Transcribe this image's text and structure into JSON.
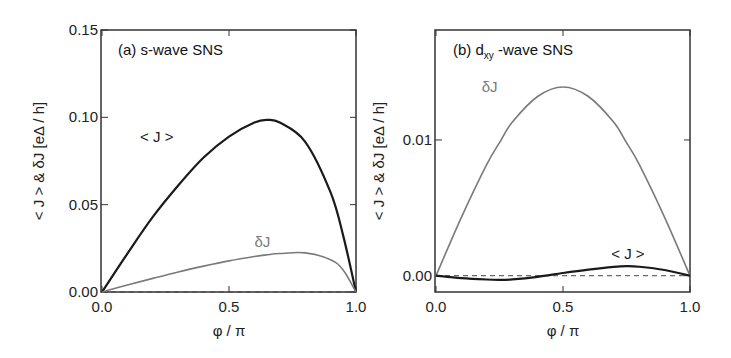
{
  "chart_data": [
    {
      "type": "line",
      "panel": "a",
      "title": "(a) s-wave SNS",
      "xlabel": "φ / π",
      "ylabel": "< J > & δJ [eΔ / h]",
      "xlim": [
        0,
        1
      ],
      "ylim": [
        0,
        0.15
      ],
      "xticks": [
        0.0,
        0.5,
        1.0
      ],
      "xtick_labels": [
        "0.0",
        "0.5",
        "1.0"
      ],
      "yticks": [
        0.0,
        0.05,
        0.1,
        0.15
      ],
      "ytick_labels": [
        "0.00",
        "0.05",
        "0.10",
        "0.15"
      ],
      "grid": false,
      "zero_line": "dashed",
      "x": [
        0.0,
        0.1,
        0.2,
        0.3,
        0.4,
        0.5,
        0.6,
        0.65,
        0.7,
        0.8,
        0.9,
        0.95,
        1.0
      ],
      "series": [
        {
          "name": "< J >",
          "color": "#1a1a1a",
          "values": [
            0.0,
            0.022,
            0.043,
            0.061,
            0.077,
            0.089,
            0.097,
            0.0985,
            0.097,
            0.086,
            0.057,
            0.032,
            0.0
          ]
        },
        {
          "name": "δJ",
          "color": "#7a7a7a",
          "values": [
            0.0,
            0.004,
            0.0078,
            0.0115,
            0.0148,
            0.0178,
            0.0203,
            0.0213,
            0.022,
            0.0224,
            0.0185,
            0.0125,
            0.0
          ]
        }
      ],
      "annotations": [
        {
          "text": "< J >",
          "x": 0.15,
          "y": 0.086,
          "color": "#1a1a1a"
        },
        {
          "text": "δJ",
          "x": 0.6,
          "y": 0.026,
          "color": "#7a7a7a"
        }
      ]
    },
    {
      "type": "line",
      "panel": "b",
      "title": "(b) dxy -wave SNS",
      "xlabel": "φ / π",
      "ylabel": "< J > & δJ [eΔ / h]",
      "xlim": [
        0,
        1
      ],
      "ylim": [
        -0.0012,
        0.0181
      ],
      "xticks": [
        0.0,
        0.5,
        1.0
      ],
      "xtick_labels": [
        "0.0",
        "0.5",
        "1.0"
      ],
      "yticks": [
        0.0,
        0.01
      ],
      "ytick_labels": [
        "0.00",
        "0.01"
      ],
      "grid": false,
      "zero_line": "dashed",
      "x": [
        0.0,
        0.1,
        0.2,
        0.25,
        0.3,
        0.4,
        0.5,
        0.6,
        0.7,
        0.75,
        0.8,
        0.9,
        1.0
      ],
      "series": [
        {
          "name": "δJ",
          "color": "#7a7a7a",
          "values": [
            0.0,
            0.0043,
            0.0082,
            0.0098,
            0.0113,
            0.0132,
            0.0139,
            0.0132,
            0.0113,
            0.0098,
            0.0082,
            0.0043,
            0.0
          ]
        },
        {
          "name": "< J >",
          "color": "#1a1a1a",
          "values": [
            0.0,
            -0.00018,
            -0.00028,
            -0.0003,
            -0.00027,
            -8e-05,
            0.0002,
            0.00045,
            0.00065,
            0.0007,
            0.00066,
            0.00042,
            0.0
          ]
        }
      ],
      "annotations": [
        {
          "text": "δJ",
          "x": 0.18,
          "y": 0.0135,
          "color": "#7a7a7a"
        },
        {
          "text": "< J >",
          "x": 0.69,
          "y": 0.0012,
          "color": "#1a1a1a"
        }
      ]
    }
  ],
  "panels": {
    "a": {
      "title_prefix": "(a) s-wave SNS"
    },
    "b": {
      "title_prefix": "(b) d",
      "title_sub": "xy",
      "title_suffix": " -wave SNS"
    }
  }
}
